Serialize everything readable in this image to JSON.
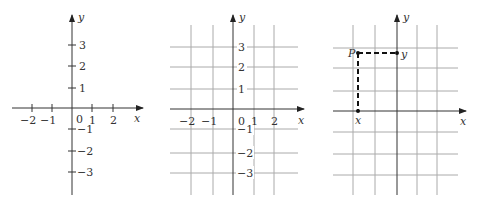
{
  "panels": [
    {
      "name": "axes-with-ticks",
      "x_axis_label": "x",
      "y_axis_label": "y",
      "origin_label": "0",
      "x_ticks": [
        {
          "v": -2,
          "label": "−2"
        },
        {
          "v": -1,
          "label": "−1"
        },
        {
          "v": 1,
          "label": "1"
        },
        {
          "v": 2,
          "label": "2"
        }
      ],
      "y_ticks": [
        {
          "v": 3,
          "label": "3"
        },
        {
          "v": 2,
          "label": "2"
        },
        {
          "v": 1,
          "label": "1"
        },
        {
          "v": -1,
          "label": "−1"
        },
        {
          "v": -2,
          "label": "−2"
        },
        {
          "v": -3,
          "label": "−3"
        }
      ]
    },
    {
      "name": "axes-with-grid",
      "x_axis_label": "x",
      "y_axis_label": "y",
      "origin_label": "0",
      "x_ticks": [
        {
          "v": -2,
          "label": "−2"
        },
        {
          "v": -1,
          "label": "−1"
        },
        {
          "v": 1,
          "label": "1"
        },
        {
          "v": 2,
          "label": "2"
        }
      ],
      "y_ticks": [
        {
          "v": 3,
          "label": "3"
        },
        {
          "v": 2,
          "label": "2"
        },
        {
          "v": 1,
          "label": "1"
        },
        {
          "v": -1,
          "label": "−1"
        },
        {
          "v": -2,
          "label": "−2"
        },
        {
          "v": -3,
          "label": "−3"
        }
      ]
    },
    {
      "name": "point-projection",
      "x_axis_label": "x",
      "y_axis_label": "y",
      "point_label": "P",
      "x_projection_label": "x",
      "y_projection_label": "y"
    }
  ]
}
